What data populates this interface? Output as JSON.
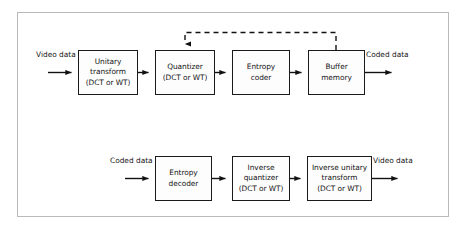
{
  "figure": {
    "frame_border_color": "#b9b9bc",
    "box_border_color": "#1a1a1a",
    "text_color": "#141414",
    "background": "#ffffff"
  },
  "encoder": {
    "input_label": {
      "line1": "Video",
      "line2": "data"
    },
    "output_label": {
      "line1": "Coded",
      "line2": "data"
    },
    "blocks": [
      {
        "line1": "Unitary",
        "line2": "transform",
        "line3": "(DCT or WT)"
      },
      {
        "line1": "Quantizer",
        "line2": "(DCT or WT)",
        "line3": ""
      },
      {
        "line1": "Entropy",
        "line2": "coder",
        "line3": ""
      },
      {
        "line1": "Buffer",
        "line2": "memory",
        "line3": ""
      }
    ],
    "feedback": {
      "from": "Buffer memory",
      "to": "Quantizer",
      "style": "dashed"
    }
  },
  "decoder": {
    "input_label": {
      "line1": "Coded",
      "line2": "data"
    },
    "output_label": {
      "line1": "Video",
      "line2": "data"
    },
    "blocks": [
      {
        "line1": "Entropy",
        "line2": "decoder",
        "line3": ""
      },
      {
        "line1": "Inverse",
        "line2": "quantizer",
        "line3": "(DCT or WT)"
      },
      {
        "line1": "Inverse unitary",
        "line2": "transform",
        "line3": "(DCT or WT)"
      }
    ]
  }
}
